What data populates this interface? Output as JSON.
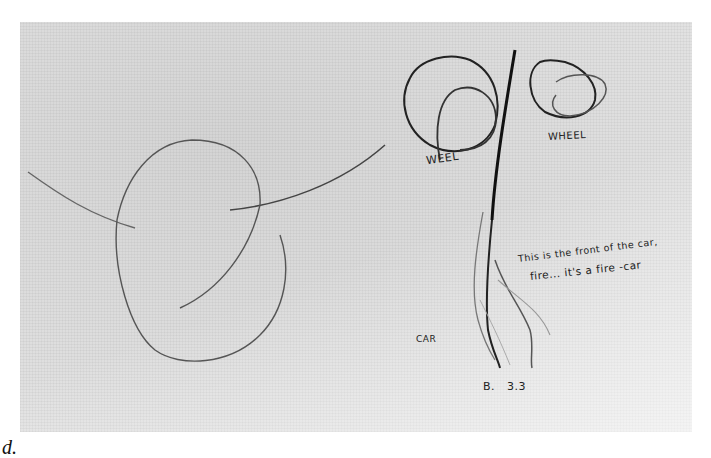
{
  "figure": {
    "caption": "d.",
    "labels": {
      "wheel_left": "WEEL",
      "wheel_right": "WHEEL",
      "car": "CAR",
      "note_line1": "This is the front of the car,",
      "note_line2": "fire... it's a fire -car",
      "figure_id": "B. 3.3"
    }
  }
}
